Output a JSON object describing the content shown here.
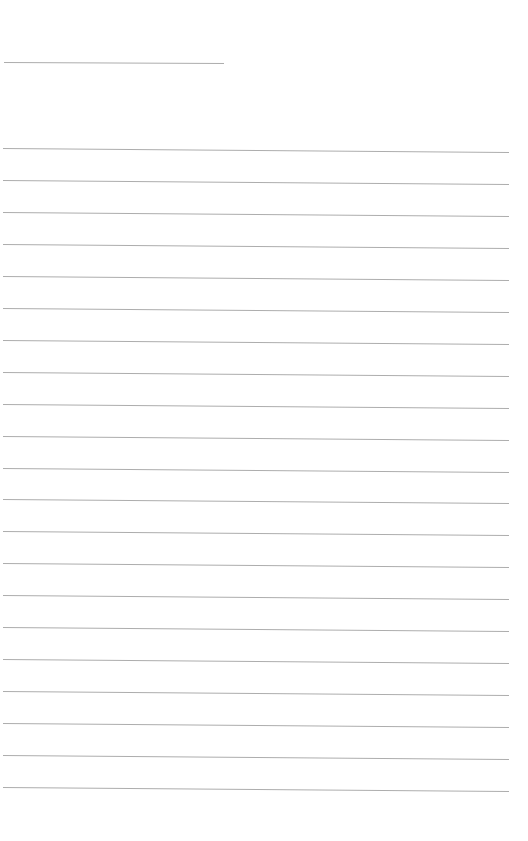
{
  "page": {
    "background": "#ffffff",
    "line_color": "#adadad",
    "header_line": {
      "x1": 4,
      "y1": 62,
      "x2": 224,
      "y2": 63
    },
    "ruled_lines": {
      "count": 21,
      "x1": 3,
      "x2": 509,
      "y_start_left": 148,
      "spacing": 31.95,
      "right_offset": 4
    }
  }
}
